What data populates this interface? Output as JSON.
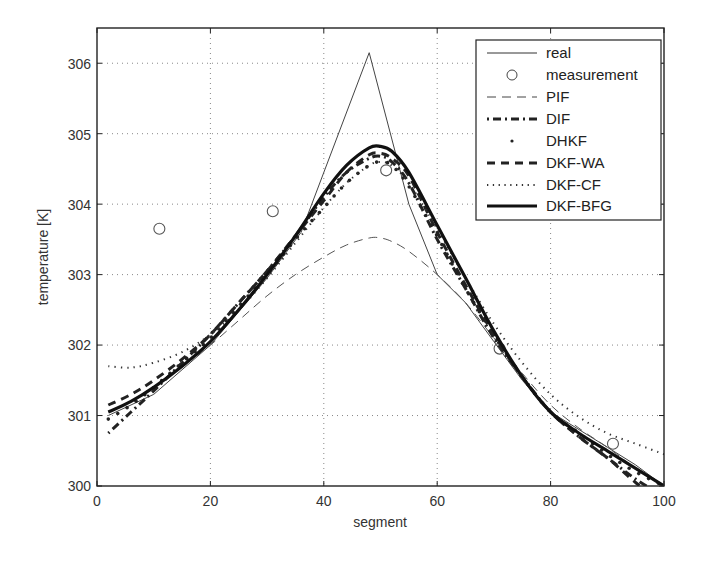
{
  "chart_data": {
    "type": "line",
    "title": "",
    "xlabel": "segment",
    "ylabel": "temperature [K]",
    "xlim": [
      0,
      100
    ],
    "ylim": [
      300,
      306.5
    ],
    "xticks": [
      0,
      20,
      40,
      60,
      80,
      100
    ],
    "yticks": [
      300,
      301,
      302,
      303,
      304,
      305,
      306
    ],
    "grid": true,
    "legend_position": "upper right",
    "x": [
      2,
      6,
      10,
      15,
      20,
      25,
      30,
      35,
      40,
      44,
      48,
      50,
      52,
      55,
      60,
      65,
      70,
      75,
      80,
      85,
      90,
      95,
      100
    ],
    "series": [
      {
        "name": "real",
        "style": "solid-thin",
        "x": [
          2,
          10,
          20,
          30,
          36,
          48,
          55,
          60,
          65,
          70,
          75,
          80,
          85,
          90,
          95,
          100
        ],
        "values": [
          301.0,
          301.3,
          302.0,
          302.95,
          303.6,
          306.15,
          304.0,
          303.0,
          302.6,
          302.05,
          301.5,
          301.05,
          300.8,
          300.55,
          300.3,
          300.0
        ]
      },
      {
        "name": "measurement",
        "style": "circle-marker",
        "x": [
          11,
          31,
          51,
          71,
          91
        ],
        "values": [
          303.65,
          303.9,
          304.48,
          301.95,
          300.6
        ]
      },
      {
        "name": "PIF",
        "style": "dashed-thin",
        "x": [
          2,
          6,
          10,
          15,
          20,
          25,
          30,
          35,
          40,
          44,
          48,
          50,
          52,
          55,
          60,
          65,
          70,
          75,
          80,
          85,
          90,
          95,
          100
        ],
        "values": [
          301.05,
          301.2,
          301.4,
          301.7,
          302.0,
          302.35,
          302.7,
          303.0,
          303.25,
          303.42,
          303.52,
          303.52,
          303.47,
          303.33,
          303.0,
          302.6,
          302.1,
          301.6,
          301.15,
          300.82,
          300.55,
          300.25,
          300.0
        ]
      },
      {
        "name": "DIF",
        "style": "dash-dot-thick",
        "x": [
          2,
          6,
          10,
          15,
          20,
          25,
          30,
          35,
          40,
          44,
          48,
          50,
          52,
          55,
          60,
          65,
          70,
          75,
          80,
          85,
          90,
          95,
          100
        ],
        "values": [
          300.75,
          301.05,
          301.35,
          301.75,
          302.15,
          302.6,
          303.05,
          303.55,
          304.1,
          304.45,
          304.65,
          304.68,
          304.6,
          304.3,
          303.5,
          302.8,
          302.1,
          301.55,
          301.05,
          300.7,
          300.4,
          300.1,
          299.85
        ]
      },
      {
        "name": "DHKF",
        "style": "sparse-dots",
        "x": [
          2,
          6,
          10,
          15,
          20,
          25,
          30,
          35,
          40,
          44,
          48,
          50,
          52,
          55,
          60,
          65,
          70,
          75,
          80,
          85,
          90,
          95,
          100
        ],
        "values": [
          300.95,
          301.15,
          301.4,
          301.75,
          302.1,
          302.55,
          303.0,
          303.5,
          303.95,
          304.3,
          304.55,
          304.6,
          304.55,
          304.25,
          303.55,
          302.8,
          302.15,
          301.55,
          301.05,
          300.75,
          300.45,
          300.2,
          300.0
        ]
      },
      {
        "name": "DKF-WA",
        "style": "dashed-thick",
        "x": [
          2,
          6,
          10,
          15,
          20,
          25,
          30,
          35,
          40,
          44,
          48,
          50,
          52,
          55,
          60,
          65,
          70,
          75,
          80,
          85,
          90,
          95,
          100
        ],
        "values": [
          301.15,
          301.3,
          301.5,
          301.8,
          302.15,
          302.6,
          303.05,
          303.55,
          304.05,
          304.45,
          304.7,
          304.72,
          304.65,
          304.4,
          303.6,
          302.85,
          302.15,
          301.55,
          301.05,
          300.7,
          300.4,
          300.05,
          299.75
        ]
      },
      {
        "name": "DKF-CF",
        "style": "dotted",
        "x": [
          2,
          6,
          10,
          15,
          20,
          25,
          30,
          35,
          40,
          44,
          48,
          50,
          52,
          55,
          60,
          65,
          70,
          75,
          80,
          85,
          90,
          95,
          100
        ],
        "values": [
          301.7,
          301.68,
          301.75,
          301.9,
          302.15,
          302.5,
          302.95,
          303.45,
          303.95,
          304.3,
          304.55,
          304.6,
          304.55,
          304.3,
          303.65,
          302.95,
          302.3,
          301.75,
          301.3,
          300.98,
          300.75,
          300.6,
          300.45
        ]
      },
      {
        "name": "DKF-BFG",
        "style": "solid-thick",
        "x": [
          2,
          6,
          10,
          15,
          20,
          25,
          30,
          35,
          40,
          44,
          48,
          50,
          52,
          55,
          60,
          65,
          70,
          75,
          80,
          85,
          90,
          95,
          100
        ],
        "values": [
          301.05,
          301.2,
          301.4,
          301.7,
          302.05,
          302.5,
          303.0,
          303.55,
          304.15,
          304.55,
          304.8,
          304.82,
          304.75,
          304.45,
          303.7,
          302.95,
          302.2,
          301.55,
          301.05,
          300.75,
          300.5,
          300.25,
          300.0
        ]
      }
    ]
  },
  "labels": {
    "xlabel": "segment",
    "ylabel": "temperature [K]",
    "xticks": [
      "0",
      "20",
      "40",
      "60",
      "80",
      "100"
    ],
    "yticks": [
      "300",
      "301",
      "302",
      "303",
      "304",
      "305",
      "306"
    ]
  },
  "legend": {
    "items": [
      "real",
      "measurement",
      "PIF",
      "DIF",
      "DHKF",
      "DKF-WA",
      "DKF-CF",
      "DKF-BFG"
    ]
  },
  "colors": {
    "line": "#1a1a1a",
    "thin_line": "#555555",
    "grid": "#888888",
    "axis": "#222222",
    "background": "#ffffff"
  }
}
